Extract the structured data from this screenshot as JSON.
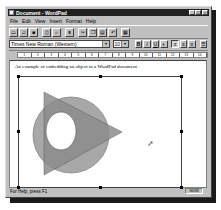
{
  "window": {
    "title": "Document - WordPad",
    "controls": {
      "minimize": "_",
      "maximize": "□",
      "close": "×"
    }
  },
  "menubar": {
    "items": [
      {
        "label": "File"
      },
      {
        "label": "Edit"
      },
      {
        "label": "View"
      },
      {
        "label": "Insert"
      },
      {
        "label": "Format"
      },
      {
        "label": "Help"
      }
    ]
  },
  "toolbar": {
    "buttons": [
      {
        "name": "new",
        "icon": "new-document-icon",
        "glyph": "▭"
      },
      {
        "name": "open",
        "icon": "open-folder-icon",
        "glyph": "▱"
      },
      {
        "name": "save",
        "icon": "save-disk-icon",
        "glyph": "■"
      },
      {
        "name": "print",
        "icon": "print-icon",
        "glyph": "⎙"
      },
      {
        "name": "print-preview",
        "icon": "print-preview-icon",
        "glyph": "⌕"
      },
      {
        "name": "find",
        "icon": "find-binoculars-icon",
        "glyph": "ᴥ"
      },
      {
        "name": "cut",
        "icon": "cut-scissors-icon",
        "glyph": "✂"
      },
      {
        "name": "copy",
        "icon": "copy-icon",
        "glyph": "❐"
      },
      {
        "name": "paste",
        "icon": "paste-clipboard-icon",
        "glyph": "▤"
      },
      {
        "name": "undo",
        "icon": "undo-icon",
        "glyph": "↶"
      },
      {
        "name": "date-time",
        "icon": "date-time-icon",
        "glyph": "▦"
      }
    ]
  },
  "formatbar": {
    "font": "Times New Roman (Western)",
    "size": "10",
    "bold": "B",
    "italic": "I",
    "underline": "U",
    "color": "◐",
    "align_left": "≡",
    "align_center": "≡",
    "align_right": "≡",
    "bullets": "☰"
  },
  "ruler": {
    "ticks": [
      "1",
      "2",
      "3",
      "4",
      "5",
      "6",
      "7",
      "8",
      "9",
      "10",
      "11",
      "12",
      "13",
      "14"
    ]
  },
  "document": {
    "text": "An example of embedding an object in a WordPad document"
  },
  "embedded_object": {
    "shapes": [
      {
        "type": "circle",
        "fill": "#a8a8a8"
      },
      {
        "type": "triangle",
        "fill": "#8c8c8c"
      },
      {
        "type": "ellipse-hole",
        "fill": "#ffffff"
      }
    ]
  },
  "statusbar": {
    "help_text": "For Help, press F1",
    "num_indicator": "NUM"
  },
  "colors": {
    "titlebar": "#202020",
    "chrome": "#c0c0c0",
    "document_bg": "#ffffff",
    "shape_circle": "#a8a8a8",
    "shape_triangle": "#8c8c8c"
  }
}
